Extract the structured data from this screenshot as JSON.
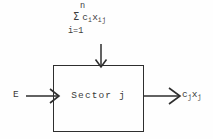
{
  "diagram": {
    "box": {
      "label": "Sector j"
    },
    "input_left": {
      "label": "E",
      "arrow_icon": "arrow-right-icon"
    },
    "input_top": {
      "arrow_icon": "arrow-down-icon",
      "formula": {
        "upper_limit": "n",
        "operator": "Σ",
        "lower_limit": "i=1",
        "coefficient": "c",
        "coefficient_sub": "i",
        "variable": "x",
        "variable_sub": "ij"
      }
    },
    "output_right": {
      "arrow_icon": "arrow-right-icon",
      "coefficient": "c",
      "coefficient_sub": "j",
      "variable": "x",
      "variable_sub": "j"
    }
  },
  "colors": {
    "stroke": "#2e2e2e",
    "text": "#3a3a3a",
    "background": "#fefefe"
  }
}
